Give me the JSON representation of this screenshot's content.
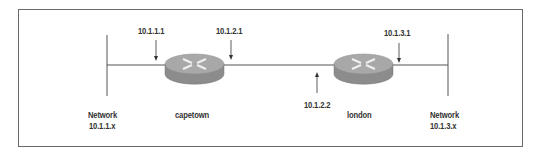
{
  "diagram": {
    "type": "network-topology",
    "routers": [
      {
        "name": "capetown",
        "interfaces": [
          "10.1.1.1",
          "10.1.2.1"
        ]
      },
      {
        "name": "london",
        "interfaces": [
          "10.1.2.2",
          "10.1.3.1"
        ]
      }
    ],
    "networks": [
      {
        "label": "Network",
        "address": "10.1.1.x"
      },
      {
        "label": "Network",
        "address": "10.1.3.x"
      }
    ],
    "labels": {
      "ip_10_1_1_1": "10.1.1.1",
      "ip_10_1_2_1": "10.1.2.1",
      "ip_10_1_2_2": "10.1.2.2",
      "ip_10_1_3_1": "10.1.3.1",
      "router_capetown": "capetown",
      "router_london": "london",
      "net_left_title": "Network",
      "net_left_addr": "10.1.1.x",
      "net_right_title": "Network",
      "net_right_addr": "10.1.3.x"
    },
    "colors": {
      "router_top": "#a8a8a8",
      "router_side": "#8c8c8c",
      "line": "#555555",
      "border": "#6a6a6a"
    }
  }
}
